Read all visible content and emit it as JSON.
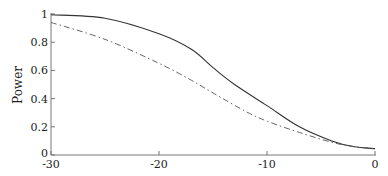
{
  "chart_data": {
    "type": "line",
    "title": "",
    "xlabel": "",
    "ylabel": "Power",
    "xlim": [
      -30,
      0
    ],
    "ylim": [
      0,
      1
    ],
    "xticks": [
      -30,
      -20,
      -10,
      0
    ],
    "xtick_labels": [
      "-30",
      "-20",
      "-10",
      "0"
    ],
    "yticks": [
      0,
      0.2,
      0.4,
      0.6,
      0.8,
      1
    ],
    "ytick_labels": [
      "0",
      "0.2",
      "0.4",
      "0.6",
      "0.8",
      "1"
    ],
    "grid": false,
    "legend": null,
    "series": [
      {
        "name": "solid",
        "style": "solid",
        "color": "#333333",
        "x": [
          -30,
          -25,
          -20,
          -17,
          -15,
          -13,
          -10,
          -7,
          -4,
          -2,
          0
        ],
        "values": [
          0.995,
          0.97,
          0.86,
          0.75,
          0.62,
          0.5,
          0.35,
          0.2,
          0.1,
          0.06,
          0.045
        ]
      },
      {
        "name": "dash-dot",
        "style": "dashdot",
        "color": "#555555",
        "x": [
          -30,
          -25,
          -20,
          -17,
          -15,
          -12,
          -10,
          -7,
          -4,
          -2,
          0
        ],
        "values": [
          0.94,
          0.82,
          0.65,
          0.53,
          0.44,
          0.31,
          0.24,
          0.16,
          0.09,
          0.06,
          0.045
        ]
      }
    ]
  }
}
